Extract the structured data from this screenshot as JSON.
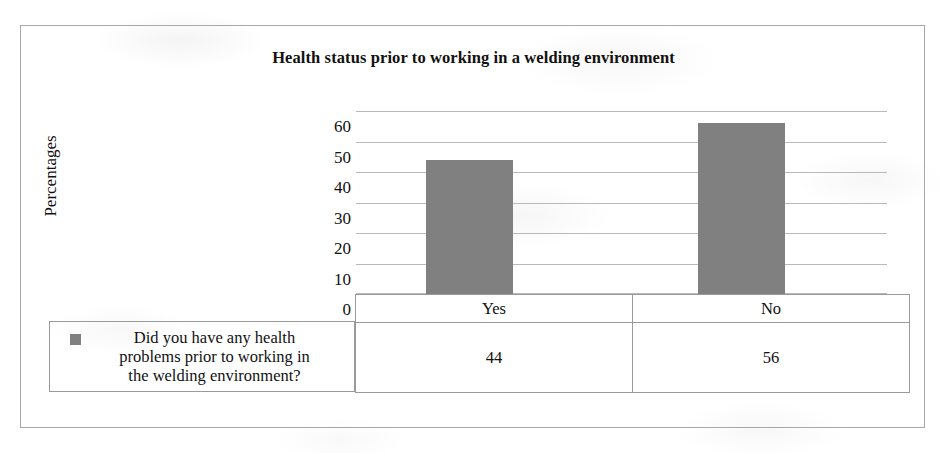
{
  "chart_data": {
    "type": "bar",
    "title": "Health status prior to working in a welding environment",
    "xlabel": "",
    "ylabel": "Percentages",
    "categories": [
      "Yes",
      "No"
    ],
    "values": [
      44,
      56
    ],
    "series": [
      {
        "name": "Did you have any health problems prior to working in the welding environment?",
        "values": [
          44,
          56
        ]
      }
    ],
    "ylim": [
      0,
      60
    ],
    "yticks": [
      0,
      10,
      20,
      30,
      40,
      50,
      60
    ],
    "ytick_labels": [
      "0",
      "10",
      "20",
      "30",
      "40",
      "50",
      "60"
    ],
    "grid": true,
    "legend_position": "bottom-left",
    "bar_color": "#808080",
    "gridline_color": "#b9b9b9",
    "data_table": {
      "columns": [
        "Yes",
        "No"
      ],
      "rows": [
        {
          "label": "Did you have any health problems prior to working in the welding environment?",
          "cells": [
            "44",
            "56"
          ]
        }
      ]
    }
  },
  "legend": {
    "line1": "Did you have any health",
    "line2": "problems prior to working in",
    "line3": "the welding environment?",
    "swatch_color": "#808080"
  },
  "table": {
    "header_yes": "Yes",
    "header_no": "No",
    "value_yes": "44",
    "value_no": "56"
  },
  "axis": {
    "tick_60": "60",
    "tick_50": "50",
    "tick_40": "40",
    "tick_30": "30",
    "tick_20": "20",
    "tick_10": "10",
    "tick_0": "0"
  }
}
